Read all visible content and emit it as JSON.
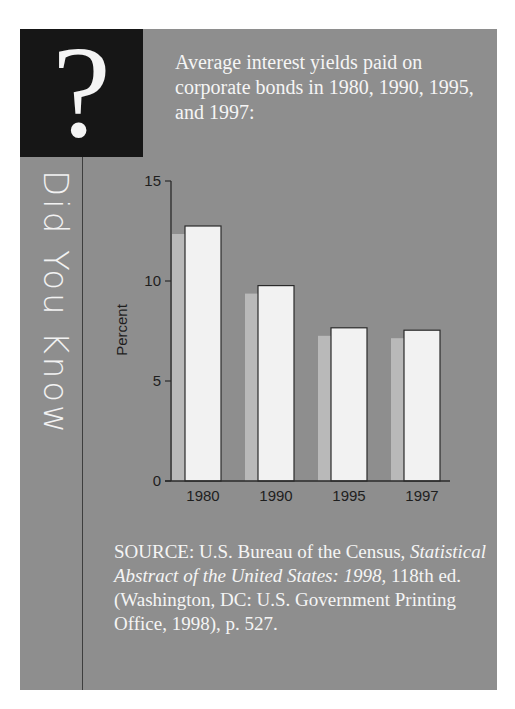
{
  "sidebar": {
    "question_mark": "?",
    "vertical_title": "Did You Know"
  },
  "intro_text": "Average interest yields paid on corporate bonds in 1980, 1990, 1995, and 1997:",
  "source": {
    "prefix": "SOURCE: U.S. Bureau of the Census, ",
    "title_italic": "Statistical Abstract of the United States: 1998,",
    "suffix": " 118th ed. (Washington, DC: U.S. Government Printing Office, 1998), p. 527."
  },
  "colors": {
    "panel_bg": "#8e8e8e",
    "question_box_bg": "#161616",
    "bar_fill": "#f2f2f2",
    "bar_shadow": "#b9b9b9",
    "axis": "#2a2a2a",
    "text_light": "#f5f5f5"
  },
  "chart_data": {
    "type": "bar",
    "title": "Average interest yields paid on corporate bonds in 1980, 1990, 1995, and 1997",
    "categories": [
      "1980",
      "1990",
      "1995",
      "1997"
    ],
    "values": [
      12.75,
      9.77,
      7.66,
      7.54
    ],
    "xlabel": "",
    "ylabel": "Percent",
    "ylim": [
      0,
      15
    ],
    "yticks": [
      0,
      5,
      10,
      15
    ],
    "grid": false,
    "legend": null,
    "style_notes": "white bars with dark outline and offset light-gray shadow to the left"
  }
}
